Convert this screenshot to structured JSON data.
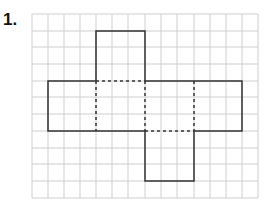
{
  "problem": {
    "number_label": "1."
  },
  "grid": {
    "cols": 14,
    "rows": 11,
    "line_color": "#cfcfcf"
  },
  "net": {
    "description": "Cube-like net of 6 squares (each 3x3 grid cells): top square above second, row of four squares, bottom square below third",
    "outline_color": "#333333",
    "fold_style": "dashed"
  }
}
